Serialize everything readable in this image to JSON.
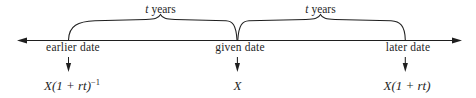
{
  "diagram": {
    "type": "timeline",
    "background_color": "#ffffff",
    "stroke_color": "#1f1f1f",
    "axis": {
      "name": "time-axis",
      "left_arrow": true,
      "right_arrow": true
    },
    "braces": [
      {
        "label_prefix": "t",
        "label_suffix": " years"
      },
      {
        "label_prefix": "t",
        "label_suffix": " years"
      }
    ],
    "points": [
      {
        "date_label": "earlier date",
        "formula_base": "X(1 + rt)",
        "formula_exponent": "−1",
        "has_exponent": true,
        "down_arrow": true
      },
      {
        "date_label": "given date",
        "formula_base": "X",
        "formula_exponent": "",
        "has_exponent": false,
        "down_arrow": true
      },
      {
        "date_label": "later date",
        "formula_base": "X(1 + rt)",
        "formula_exponent": "",
        "has_exponent": false,
        "down_arrow": true
      }
    ]
  }
}
